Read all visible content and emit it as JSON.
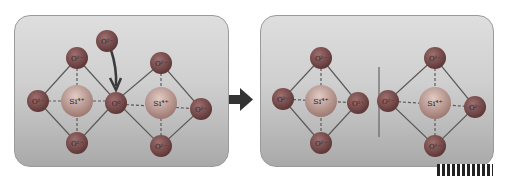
{
  "diagram": {
    "colors": {
      "oxygen": "#7a4848",
      "silicon": "#c4a098",
      "bond": "#5a5a5a",
      "arrow": "#3a3a3a"
    },
    "before": {
      "incoming_ion": "O²⁻",
      "bridging_oxygen": "O⁰",
      "left_tetrahedron": {
        "center": "Si⁴⁺",
        "oxygens": [
          "O²⁻",
          "O²⁻",
          "O²⁻"
        ]
      },
      "right_tetrahedron": {
        "center": "Si⁴⁺",
        "oxygens": [
          "O²⁻",
          "O²⁻",
          "O²⁻"
        ]
      }
    },
    "after": {
      "left_tetrahedron": {
        "center": "Si⁴⁺",
        "oxygens": [
          "O²⁻",
          "O²⁻",
          "O²⁻",
          "O²⁻"
        ]
      },
      "right_tetrahedron": {
        "center": "Si⁴⁺",
        "oxygens": [
          "O²⁻",
          "O²⁻",
          "O²⁻",
          "O²⁻"
        ]
      }
    }
  }
}
